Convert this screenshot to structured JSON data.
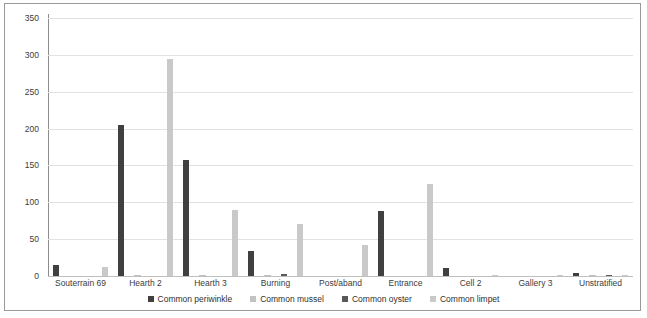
{
  "chart_data": {
    "type": "bar",
    "title": "",
    "subtitle": "",
    "xlabel": "",
    "ylabel": "",
    "ylim": [
      0,
      350
    ],
    "ytick_step": 50,
    "yticks": [
      "0",
      "50",
      "100",
      "150",
      "200",
      "250",
      "300",
      "350"
    ],
    "grid": true,
    "legend_position": "bottom",
    "categories": [
      "Souterrain 69",
      "Hearth 2",
      "Hearth 3",
      "Burning",
      "Post/aband",
      "Entrance",
      "Cell 2",
      "Gallery 3",
      "Unstratified"
    ],
    "series": [
      {
        "name": "Common periwinkle",
        "color": "#404040",
        "values": [
          15,
          205,
          157,
          34,
          0,
          88,
          11,
          0,
          4
        ]
      },
      {
        "name": "Common mussel",
        "color": "#c2c2c2",
        "values": [
          0,
          2,
          2,
          2,
          0,
          0,
          0,
          0,
          1
        ]
      },
      {
        "name": "Common oyster",
        "color": "#595959",
        "values": [
          0,
          0,
          0,
          3,
          0,
          0,
          0,
          0,
          1
        ]
      },
      {
        "name": "Common limpet",
        "color": "#c9c9c9",
        "values": [
          12,
          294,
          89,
          71,
          42,
          125,
          2,
          1,
          1
        ]
      }
    ]
  }
}
